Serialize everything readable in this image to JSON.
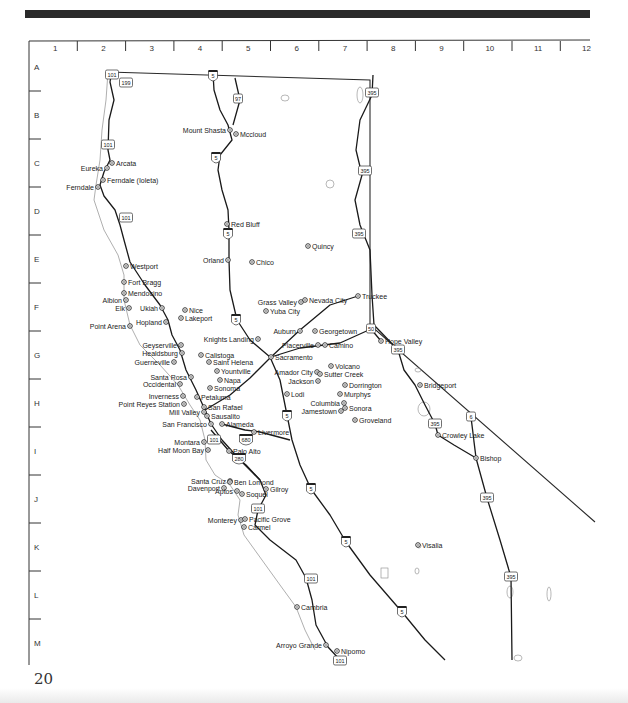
{
  "page": {
    "number": "20"
  },
  "grid": {
    "columns": [
      "1",
      "2",
      "3",
      "4",
      "5",
      "6",
      "7",
      "8",
      "9",
      "10",
      "11",
      "12"
    ],
    "rows": [
      "A",
      "B",
      "C",
      "D",
      "E",
      "F",
      "G",
      "H",
      "I",
      "J",
      "K",
      "L",
      "M"
    ]
  },
  "icons": {
    "city_marker": "circle-dot-icon",
    "interstate_shield": "interstate-shield-icon",
    "us_route_shield": "us-route-shield-icon"
  },
  "colors": {
    "road": "#1a1a1a",
    "coastline": "#9a9a9a",
    "border": "#2a2a2a",
    "lake": "#888888",
    "text": "#222222"
  },
  "cities": [
    {
      "name": "Mount Shasta",
      "x": 230,
      "y": 130,
      "side": "left"
    },
    {
      "name": "Mccloud",
      "x": 236,
      "y": 134,
      "side": "right"
    },
    {
      "name": "Arcata",
      "x": 112,
      "y": 163,
      "side": "right"
    },
    {
      "name": "Eureka",
      "x": 107,
      "y": 168,
      "side": "left"
    },
    {
      "name": "Ferndale (Ioleta)",
      "x": 103,
      "y": 180,
      "side": "right"
    },
    {
      "name": "Ferndale",
      "x": 98,
      "y": 187,
      "side": "left"
    },
    {
      "name": "Red Bluff",
      "x": 227,
      "y": 224,
      "side": "right"
    },
    {
      "name": "Quincy",
      "x": 308,
      "y": 246,
      "side": "right"
    },
    {
      "name": "Orland",
      "x": 228,
      "y": 260,
      "side": "left"
    },
    {
      "name": "Chico",
      "x": 252,
      "y": 262,
      "side": "right"
    },
    {
      "name": "Westport",
      "x": 126,
      "y": 266,
      "side": "right"
    },
    {
      "name": "Fort Bragg",
      "x": 124,
      "y": 282,
      "side": "right"
    },
    {
      "name": "Mendocino",
      "x": 124,
      "y": 293,
      "side": "right"
    },
    {
      "name": "Albion",
      "x": 126,
      "y": 300,
      "side": "left"
    },
    {
      "name": "Elk",
      "x": 129,
      "y": 308,
      "side": "left"
    },
    {
      "name": "Ukiah",
      "x": 162,
      "y": 308,
      "side": "left"
    },
    {
      "name": "Nice",
      "x": 185,
      "y": 310,
      "side": "right"
    },
    {
      "name": "Lakeport",
      "x": 181,
      "y": 318,
      "side": "right"
    },
    {
      "name": "Hopland",
      "x": 166,
      "y": 322,
      "side": "left"
    },
    {
      "name": "Point Arena",
      "x": 130,
      "y": 326,
      "side": "left"
    },
    {
      "name": "Truckee",
      "x": 358,
      "y": 296,
      "side": "right"
    },
    {
      "name": "Grass Valley",
      "x": 301,
      "y": 302,
      "side": "left"
    },
    {
      "name": "Nevada City",
      "x": 305,
      "y": 300,
      "side": "right"
    },
    {
      "name": "Yuba City",
      "x": 266,
      "y": 311,
      "side": "right"
    },
    {
      "name": "Auburn",
      "x": 300,
      "y": 331,
      "side": "left"
    },
    {
      "name": "Georgetown",
      "x": 315,
      "y": 331,
      "side": "right"
    },
    {
      "name": "Hope Valley",
      "x": 381,
      "y": 341,
      "side": "right"
    },
    {
      "name": "Knights Landing",
      "x": 258,
      "y": 339,
      "side": "left"
    },
    {
      "name": "Placerville",
      "x": 318,
      "y": 345,
      "side": "left"
    },
    {
      "name": "Camino",
      "x": 325,
      "y": 345,
      "side": "right"
    },
    {
      "name": "Geyserville",
      "x": 181,
      "y": 345,
      "side": "left"
    },
    {
      "name": "Healdsburg",
      "x": 182,
      "y": 353,
      "side": "left"
    },
    {
      "name": "Calistoga",
      "x": 201,
      "y": 355,
      "side": "right"
    },
    {
      "name": "Sacramento",
      "x": 271,
      "y": 357,
      "side": "right"
    },
    {
      "name": "Guerneville",
      "x": 174,
      "y": 362,
      "side": "left"
    },
    {
      "name": "Saint Helena",
      "x": 209,
      "y": 362,
      "side": "right"
    },
    {
      "name": "Volcano",
      "x": 331,
      "y": 366,
      "side": "right"
    },
    {
      "name": "Yountville",
      "x": 217,
      "y": 371,
      "side": "right"
    },
    {
      "name": "Amador City",
      "x": 317,
      "y": 372,
      "side": "left"
    },
    {
      "name": "Sutter Creek",
      "x": 320,
      "y": 374,
      "side": "right"
    },
    {
      "name": "Santa Rosa",
      "x": 191,
      "y": 377,
      "side": "left"
    },
    {
      "name": "Napa",
      "x": 220,
      "y": 380,
      "side": "right"
    },
    {
      "name": "Jackson",
      "x": 318,
      "y": 381,
      "side": "left"
    },
    {
      "name": "Occidental",
      "x": 180,
      "y": 384,
      "side": "left"
    },
    {
      "name": "Sonoma",
      "x": 210,
      "y": 388,
      "side": "right"
    },
    {
      "name": "Dorrington",
      "x": 345,
      "y": 385,
      "side": "right"
    },
    {
      "name": "Lodi",
      "x": 287,
      "y": 394,
      "side": "right"
    },
    {
      "name": "Murphys",
      "x": 340,
      "y": 394,
      "side": "right"
    },
    {
      "name": "Inverness",
      "x": 183,
      "y": 396,
      "side": "left"
    },
    {
      "name": "Petaluma",
      "x": 197,
      "y": 397,
      "side": "right"
    },
    {
      "name": "Point Reyes Station",
      "x": 184,
      "y": 404,
      "side": "left"
    },
    {
      "name": "Columbia",
      "x": 344,
      "y": 403,
      "side": "left"
    },
    {
      "name": "San Rafael",
      "x": 204,
      "y": 407,
      "side": "right"
    },
    {
      "name": "Sonora",
      "x": 345,
      "y": 408,
      "side": "right"
    },
    {
      "name": "Jamestown",
      "x": 341,
      "y": 411,
      "side": "left"
    },
    {
      "name": "Mill Valley",
      "x": 204,
      "y": 412,
      "side": "left"
    },
    {
      "name": "Sausalito",
      "x": 207,
      "y": 416,
      "side": "right"
    },
    {
      "name": "Groveland",
      "x": 355,
      "y": 420,
      "side": "right"
    },
    {
      "name": "San Francisco",
      "x": 211,
      "y": 424,
      "side": "left"
    },
    {
      "name": "Alameda",
      "x": 222,
      "y": 424,
      "side": "right"
    },
    {
      "name": "Livermore",
      "x": 254,
      "y": 432,
      "side": "right"
    },
    {
      "name": "Montara",
      "x": 204,
      "y": 442,
      "side": "left"
    },
    {
      "name": "Half Moon Bay",
      "x": 208,
      "y": 450,
      "side": "left"
    },
    {
      "name": "Palo Alto",
      "x": 229,
      "y": 451,
      "side": "right"
    },
    {
      "name": "Crowley Lake",
      "x": 438,
      "y": 435,
      "side": "right"
    },
    {
      "name": "Bishop",
      "x": 476,
      "y": 458,
      "side": "right"
    },
    {
      "name": "Bridgeport",
      "x": 420,
      "y": 385,
      "side": "right"
    },
    {
      "name": "Santa Cruz",
      "x": 230,
      "y": 481,
      "side": "left"
    },
    {
      "name": "Ben Lomond",
      "x": 230,
      "y": 482,
      "side": "right"
    },
    {
      "name": "Davenport",
      "x": 224,
      "y": 488,
      "side": "left"
    },
    {
      "name": "Gilroy",
      "x": 266,
      "y": 489,
      "side": "right"
    },
    {
      "name": "Aptos",
      "x": 237,
      "y": 491,
      "side": "left"
    },
    {
      "name": "Soquel",
      "x": 242,
      "y": 494,
      "side": "right"
    },
    {
      "name": "Monterey",
      "x": 241,
      "y": 520,
      "side": "left"
    },
    {
      "name": "Pacific Grove",
      "x": 245,
      "y": 519,
      "side": "right"
    },
    {
      "name": "Carmel",
      "x": 244,
      "y": 527,
      "side": "right"
    },
    {
      "name": "Visalia",
      "x": 418,
      "y": 545,
      "side": "right"
    },
    {
      "name": "Cambria",
      "x": 297,
      "y": 607,
      "side": "right"
    },
    {
      "name": "Arroyo Grande",
      "x": 326,
      "y": 645,
      "side": "left"
    },
    {
      "name": "Nipomo",
      "x": 337,
      "y": 651,
      "side": "right"
    }
  ],
  "shields": [
    {
      "type": "us",
      "number": "101",
      "x": 112,
      "y": 75
    },
    {
      "type": "us",
      "number": "199",
      "x": 126,
      "y": 83
    },
    {
      "type": "interstate",
      "number": "5",
      "x": 213,
      "y": 76
    },
    {
      "type": "us",
      "number": "97",
      "x": 238,
      "y": 99
    },
    {
      "type": "us",
      "number": "395",
      "x": 372,
      "y": 93
    },
    {
      "type": "us",
      "number": "101",
      "x": 108,
      "y": 145
    },
    {
      "type": "interstate",
      "number": "5",
      "x": 216,
      "y": 158
    },
    {
      "type": "us",
      "number": "395",
      "x": 365,
      "y": 171
    },
    {
      "type": "us",
      "number": "101",
      "x": 126,
      "y": 218
    },
    {
      "type": "interstate",
      "number": "5",
      "x": 228,
      "y": 234
    },
    {
      "type": "us",
      "number": "395",
      "x": 359,
      "y": 234
    },
    {
      "type": "interstate",
      "number": "5",
      "x": 236,
      "y": 320
    },
    {
      "type": "us",
      "number": "50",
      "x": 371,
      "y": 329
    },
    {
      "type": "us",
      "number": "395",
      "x": 398,
      "y": 350
    },
    {
      "type": "interstate",
      "number": "5",
      "x": 287,
      "y": 416
    },
    {
      "type": "us",
      "number": "101",
      "x": 214,
      "y": 440
    },
    {
      "type": "interstate",
      "number": "680",
      "x": 246,
      "y": 440
    },
    {
      "type": "interstate",
      "number": "280",
      "x": 239,
      "y": 459
    },
    {
      "type": "interstate",
      "number": "5",
      "x": 311,
      "y": 489
    },
    {
      "type": "us",
      "number": "101",
      "x": 258,
      "y": 509
    },
    {
      "type": "us",
      "number": "395",
      "x": 435,
      "y": 424
    },
    {
      "type": "us",
      "number": "6",
      "x": 471,
      "y": 417
    },
    {
      "type": "us",
      "number": "395",
      "x": 487,
      "y": 498
    },
    {
      "type": "interstate",
      "number": "5",
      "x": 346,
      "y": 542
    },
    {
      "type": "us",
      "number": "101",
      "x": 311,
      "y": 579
    },
    {
      "type": "us",
      "number": "395",
      "x": 511,
      "y": 577
    },
    {
      "type": "interstate",
      "number": "5",
      "x": 402,
      "y": 612
    },
    {
      "type": "us",
      "number": "101",
      "x": 340,
      "y": 661
    }
  ],
  "roads": [
    {
      "name": "US-101",
      "d": "M112 70 L110 82 L114 100 L109 120 L108 150 L110 160 L104 172 L100 185 L104 196 L115 210 L120 225 L124 240 L130 262 L145 285 L160 305 L168 320 L172 335 L180 350 L186 370 L196 390 L205 410 L211 424 L222 440 L240 460 L260 480 L266 495 L258 510 L255 525 L270 540 L296 560 L306 578 L312 600 L316 625 L328 647 L340 660"
    },
    {
      "name": "I-5",
      "d": "M213 73 L214 90 L220 110 L228 125 L232 140 L220 155 L218 170 L222 190 L228 210 L229 230 L229 260 L230 290 L237 320 L250 340 L270 357 L280 380 L287 415 L292 440 L300 465 L311 489 L330 515 L346 542 L370 575 L402 612 L425 640 L445 660"
    },
    {
      "name": "US-97",
      "d": "M235 78 L240 100 L233 125"
    },
    {
      "name": "US-395",
      "d": "M373 75 L372 95 L360 120 L356 150 L362 175 L355 200 L360 225 L370 250 L372 295 L374 325 L398 350 L404 370 L415 385 L425 405 L435 424 L438 435 L454 445 L476 458 L487 498 L500 540 L511 577 L512 660"
    },
    {
      "name": "US-6",
      "d": "M471 417 L476 458"
    },
    {
      "name": "US-50",
      "d": "M271 357 L300 348 L340 343 L371 329 L381 341"
    },
    {
      "name": "I-80",
      "d": "M205 410 L230 395 L250 378 L271 357 L300 330 L330 305 L358 296"
    },
    {
      "name": "I-680",
      "d": "M222 424 L245 430 L260 432 L290 440"
    },
    {
      "name": "I-280",
      "d": "M211 430 L229 451 L246 465 L260 480"
    }
  ],
  "coastline": "M108 72 L106 100 L102 130 L100 160 L96 185 L94 200 L104 230 L118 255 L124 275 L124 300 L130 325 L140 345 L160 365 L178 385 L190 405 L200 420 L205 440 L206 460 L215 475 L230 485 L240 500 L238 515 L244 535 L262 560 L280 585 L296 607 L305 630 L315 650",
  "border": "M108 72 L370 80 L370 325 L595 522"
}
